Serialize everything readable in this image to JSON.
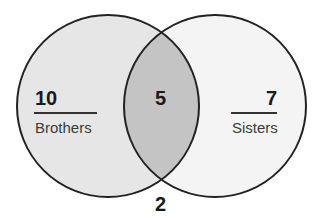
{
  "diagram": {
    "type": "venn",
    "sets": [
      {
        "label": "Brothers",
        "only_count": "10",
        "fill": "#e6e6e6"
      },
      {
        "label": "Sisters",
        "only_count": "7",
        "fill": "#f4f4f4"
      }
    ],
    "intersection": {
      "count": "5",
      "fill": "#c4c4c4"
    },
    "neither": {
      "count": "2"
    },
    "stroke": "#222222"
  }
}
